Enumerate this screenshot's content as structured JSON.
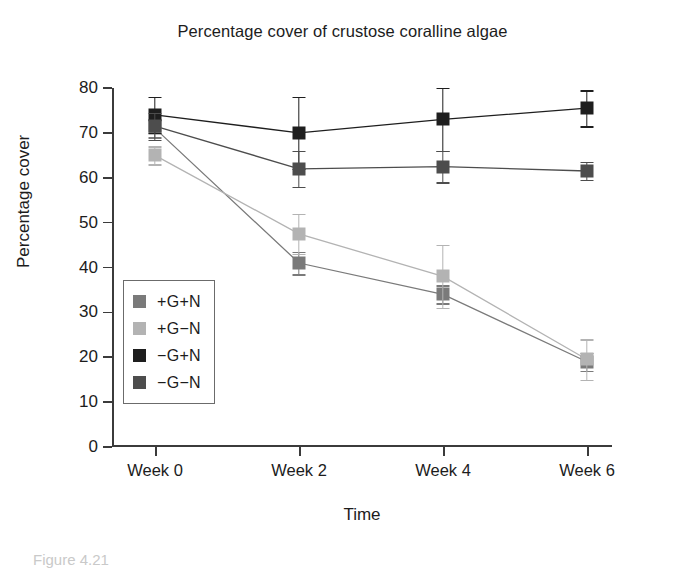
{
  "chart_data": {
    "type": "line",
    "title": "Percentage cover of crustose coralline algae",
    "xlabel": "Time",
    "ylabel": "Percentage cover",
    "categories": [
      "Week 0",
      "Week 2",
      "Week 4",
      "Week 6"
    ],
    "ylim": [
      0,
      80
    ],
    "ytick_step": 10,
    "yticks": [
      0,
      10,
      20,
      30,
      40,
      50,
      60,
      70,
      80
    ],
    "grid": false,
    "legend_position": "inside-lower-left",
    "errorbars": true,
    "marker": "square",
    "series": [
      {
        "name": "+G+N",
        "color": "#7a7a7a",
        "values": [
          71.0,
          41.0,
          34.0,
          19.0
        ],
        "errors": [
          2.0,
          2.5,
          2.0,
          2.0
        ]
      },
      {
        "name": "+G−N",
        "color": "#b3b3b3",
        "values": [
          65.0,
          47.5,
          38.0,
          19.5
        ],
        "errors": [
          2.0,
          4.5,
          7.0,
          4.5
        ]
      },
      {
        "name": "−G+N",
        "color": "#1e1e1e",
        "values": [
          74.0,
          70.0,
          73.0,
          75.5
        ],
        "errors": [
          4.0,
          8.0,
          7.0,
          4.0
        ]
      },
      {
        "name": "−G−N",
        "color": "#4d4d4d",
        "values": [
          71.5,
          62.0,
          62.5,
          61.5
        ],
        "errors": [
          3.0,
          4.0,
          3.5,
          2.0
        ]
      }
    ]
  },
  "caption": "Figure 4.21"
}
